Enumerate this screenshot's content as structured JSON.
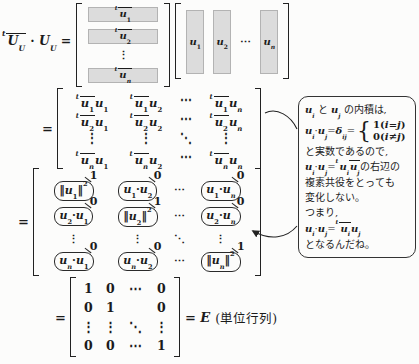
{
  "colors": {
    "shade": "#dcdcdc",
    "ink": "#1b1b1b"
  },
  "equation": {
    "lhs": "S{t}O{UB{U}} · UB{U} =",
    "eq_sign": "=",
    "tail_eq": "= E",
    "tail_note": "(単位行列)"
  },
  "matrix_rows": {
    "items": [
      {
        "m": "S{t}O{uB{1}}",
        "shaded": true
      },
      {
        "m": "S{t}O{uB{2}}",
        "shaded": true
      },
      {
        "m": "⋮",
        "shaded": false
      },
      {
        "m": "S{t}O{uB{n}}",
        "shaded": true
      }
    ]
  },
  "matrix_cols": {
    "items": [
      {
        "m": "uB{1}",
        "shaded": true
      },
      {
        "m": "uB{2}",
        "shaded": true
      },
      {
        "m": "⋯",
        "shaded": false
      },
      {
        "m": "uB{n}",
        "shaded": true
      }
    ]
  },
  "matrix_product": {
    "rows": [
      [
        "S{t}O{uB{1}}uB{1}",
        "S{t}O{uB{1}}uB{2}",
        "⋯",
        "S{t}O{uB{1}}uB{n}"
      ],
      [
        "S{t}O{uB{2}}uB{1}",
        "S{t}O{uB{2}}uB{2}",
        "⋯",
        "S{t}O{uB{2}}uB{n}"
      ],
      [
        "⋮",
        "⋮",
        "⋱",
        "⋮"
      ],
      [
        "S{t}O{uB{n}}uB{1}",
        "S{t}O{uB{n}}uB{2}",
        "⋯",
        "S{t}O{uB{n}}uB{n}"
      ]
    ]
  },
  "matrix_capsules": {
    "rows": [
      [
        {
          "m": "‖uB{1}‖S{2}",
          "ann": "1",
          "cap": true
        },
        {
          "m": "uB{1}·uB{2}",
          "ann": "0",
          "cap": true
        },
        {
          "m": "⋯"
        },
        {
          "m": "uB{1}·uB{n}",
          "ann": "0",
          "cap": true
        }
      ],
      [
        {
          "m": "uB{2}·uB{1}",
          "ann": "0",
          "cap": true
        },
        {
          "m": "‖uB{2}‖S{2}",
          "ann": "1",
          "cap": true
        },
        {
          "m": "⋯"
        },
        {
          "m": "uB{2}·uB{n}",
          "ann": "0",
          "cap": true
        }
      ],
      [
        {
          "m": "⋮"
        },
        {
          "m": "⋮"
        },
        {
          "m": "⋱"
        },
        {
          "m": "⋮"
        }
      ],
      [
        {
          "m": "uB{n}·uB{1}",
          "ann": "0",
          "cap": true
        },
        {
          "m": "uB{n}·uB{2}",
          "ann": "0",
          "cap": true
        },
        {
          "m": "⋯"
        },
        {
          "m": "‖uB{n}‖S{2}",
          "ann": "1",
          "cap": true
        }
      ]
    ]
  },
  "matrix_identity": {
    "rows": [
      [
        "1",
        "0",
        "⋯",
        "0"
      ],
      [
        "0",
        "1",
        "",
        "0"
      ],
      [
        "⋮",
        "⋮",
        "⋱",
        "⋮"
      ],
      [
        "0",
        "0",
        "⋯",
        "1"
      ]
    ]
  },
  "callout": {
    "lines": [
      {
        "math": "uB{i} と uB{j} の内積は,"
      },
      {
        "cases": true
      },
      {
        "math": "と実数であるので,"
      },
      {
        "math": "uB{i}·uB{j}=S{t}uB{i}O{uB{j}}の右辺の"
      },
      {
        "math": "複素共役をとっても"
      },
      {
        "math": "変化しない。"
      },
      {
        "math": "つまり,"
      },
      {
        "math": "uB{i}·uB{j}=S{t}O{uB{i}}uB{j}"
      },
      {
        "math": "となるんだね。"
      }
    ],
    "cases": {
      "lhs": "uB{i}·uB{j}=δB{ij}=",
      "brace": "{",
      "rows": [
        "1(i=j)",
        "0(i≠j)"
      ]
    }
  }
}
